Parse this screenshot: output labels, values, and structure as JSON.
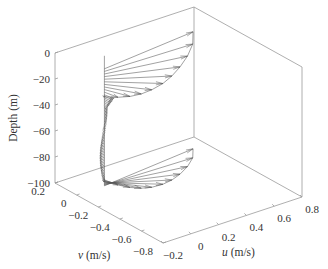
{
  "chart_data": {
    "type": "line",
    "subtype": "3d-hodograph-vector-profile",
    "title": "",
    "xlabel": "u (m/s)",
    "ylabel": "v (m/s)",
    "zlabel": "Depth (m)",
    "xlabel_var": "u",
    "xlabel_unit": " (m/s)",
    "ylabel_var": "v",
    "ylabel_unit": " (m/s)",
    "xlim": [
      -0.2,
      0.8
    ],
    "ylim": [
      -0.8,
      0.2
    ],
    "zlim": [
      -100,
      0
    ],
    "x_ticks": [
      "-0.2",
      "0",
      "0.2",
      "0.4",
      "0.6",
      "0.8"
    ],
    "y_ticks": [
      "0.2",
      "0",
      "-0.2",
      "-0.4",
      "-0.6",
      "-0.8"
    ],
    "z_ticks": [
      "0",
      "-20",
      "-40",
      "-60",
      "-80",
      "-100"
    ],
    "grid": false,
    "legend": null,
    "series": [
      {
        "name": "surface Ekman spiral vectors (origin at u=0, v=0 stalk)",
        "depth_range": [
          -10,
          -30
        ],
        "description": "Fan of velocity vectors near the surface; longest vector ~0.7 m/s in u at depth ~-10 m, rotating and decaying with depth",
        "tips": [
          {
            "depth": -10,
            "u": 0.7,
            "v": 0.08
          },
          {
            "depth": -12,
            "u": 0.62,
            "v": -0.02
          },
          {
            "depth": -14,
            "u": 0.52,
            "v": -0.1
          },
          {
            "depth": -16,
            "u": 0.42,
            "v": -0.16
          },
          {
            "depth": -18,
            "u": 0.33,
            "v": -0.2
          },
          {
            "depth": -20,
            "u": 0.25,
            "v": -0.22
          },
          {
            "depth": -22,
            "u": 0.17,
            "v": -0.22
          },
          {
            "depth": -24,
            "u": 0.11,
            "v": -0.2
          },
          {
            "depth": -26,
            "u": 0.06,
            "v": -0.16
          },
          {
            "depth": -28,
            "u": 0.02,
            "v": -0.1
          },
          {
            "depth": -30,
            "u": -0.02,
            "v": -0.02
          }
        ]
      },
      {
        "name": "interior column",
        "depth_range": [
          -30,
          -95
        ],
        "description": "Near-zero velocities forming a nearly vertical column of tiny vectors"
      },
      {
        "name": "bottom Ekman spiral vectors",
        "depth_range": [
          -93,
          -100
        ],
        "description": "Fan of vectors at bottom; largest ~0.7 m/s in u near bottom, rotating toward negative v",
        "tips": [
          {
            "depth": -100,
            "u": 0.7,
            "v": 0.08
          },
          {
            "depth": -99.5,
            "u": 0.62,
            "v": -0.02
          },
          {
            "depth": -99,
            "u": 0.52,
            "v": -0.1
          },
          {
            "depth": -98.5,
            "u": 0.42,
            "v": -0.16
          },
          {
            "depth": -98,
            "u": 0.33,
            "v": -0.2
          },
          {
            "depth": -97.5,
            "u": 0.25,
            "v": -0.22
          },
          {
            "depth": -97,
            "u": 0.17,
            "v": -0.22
          },
          {
            "depth": -96.5,
            "u": 0.11,
            "v": -0.2
          },
          {
            "depth": -96,
            "u": 0.06,
            "v": -0.16
          },
          {
            "depth": -95.5,
            "u": 0.02,
            "v": -0.1
          },
          {
            "depth": -95,
            "u": -0.02,
            "v": -0.02
          }
        ]
      }
    ]
  }
}
